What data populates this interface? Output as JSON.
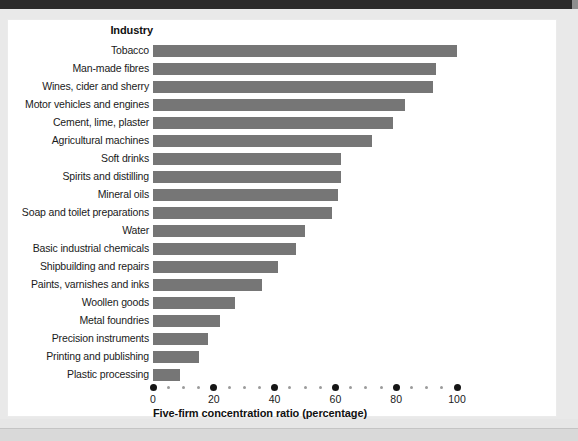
{
  "chart_data": {
    "type": "bar",
    "orientation": "horizontal",
    "title": "",
    "category_axis_title": "Industry",
    "xlabel": "Five-firm concentration ratio (percentage)",
    "ylabel": "Industry",
    "xlim": [
      0,
      100
    ],
    "xticks": [
      0,
      20,
      40,
      60,
      80,
      100
    ],
    "xtick_labels": [
      "0",
      "20",
      "40",
      "60",
      "80",
      "100"
    ],
    "minor_tick_step": 5,
    "grid": false,
    "legend": null,
    "bar_color": "#767676",
    "categories": [
      "Tobacco",
      "Man-made fibres",
      "Wines, cider and sherry",
      "Motor vehicles and engines",
      "Cement, lime, plaster",
      "Agricultural machines",
      "Soft drinks",
      "Spirits and distilling",
      "Mineral oils",
      "Soap and toilet preparations",
      "Water",
      "Basic industrial chemicals",
      "Shipbuilding and repairs",
      "Paints, varnishes and inks",
      "Woollen goods",
      "Metal foundries",
      "Precision instruments",
      "Printing and publishing",
      "Plastic processing"
    ],
    "values": [
      100,
      93,
      92,
      83,
      79,
      72,
      62,
      62,
      61,
      59,
      50,
      47,
      41,
      36,
      27,
      22,
      18,
      15,
      9
    ]
  }
}
